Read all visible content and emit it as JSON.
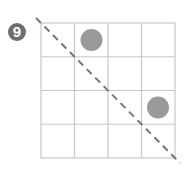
{
  "problem": {
    "number_label": "9"
  },
  "grid": {
    "rows": 4,
    "cols": 4,
    "line_color": "#c8c8c8"
  },
  "circles": [
    {
      "row": 0,
      "col": 1,
      "color": "#9a9a9a"
    },
    {
      "row": 2,
      "col": 3,
      "color": "#9a9a9a"
    }
  ],
  "diagonal": {
    "style": "dashed",
    "from": "top-left",
    "to": "bottom-right",
    "color": "#777777"
  },
  "colors": {
    "badge_bg": "#6e6e6e",
    "badge_text": "#ffffff"
  }
}
